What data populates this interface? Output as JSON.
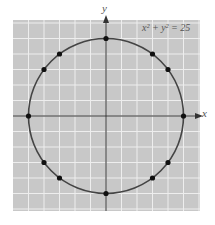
{
  "chart_data": {
    "type": "scatter",
    "title": "",
    "equation": "x² + y² = 25",
    "xlabel": "x",
    "ylabel": "y",
    "xlim": [
      -6,
      6
    ],
    "ylim": [
      -6,
      6
    ],
    "grid": true,
    "curve": {
      "type": "circle",
      "center": [
        0,
        0
      ],
      "radius": 5
    },
    "points": [
      {
        "x": 0,
        "y": 5
      },
      {
        "x": 3,
        "y": 4
      },
      {
        "x": 4,
        "y": 3
      },
      {
        "x": 5,
        "y": 0
      },
      {
        "x": 4,
        "y": -3
      },
      {
        "x": 3,
        "y": -4
      },
      {
        "x": 0,
        "y": -5
      },
      {
        "x": -3,
        "y": -4
      },
      {
        "x": -4,
        "y": -3
      },
      {
        "x": -5,
        "y": 0
      },
      {
        "x": -4,
        "y": 3
      },
      {
        "x": -3,
        "y": 4
      }
    ]
  },
  "colors": {
    "background": "#c8c8c8",
    "grid": "#eeeeee",
    "curve": "#444444",
    "axis": "#333333",
    "point": "#111111"
  }
}
